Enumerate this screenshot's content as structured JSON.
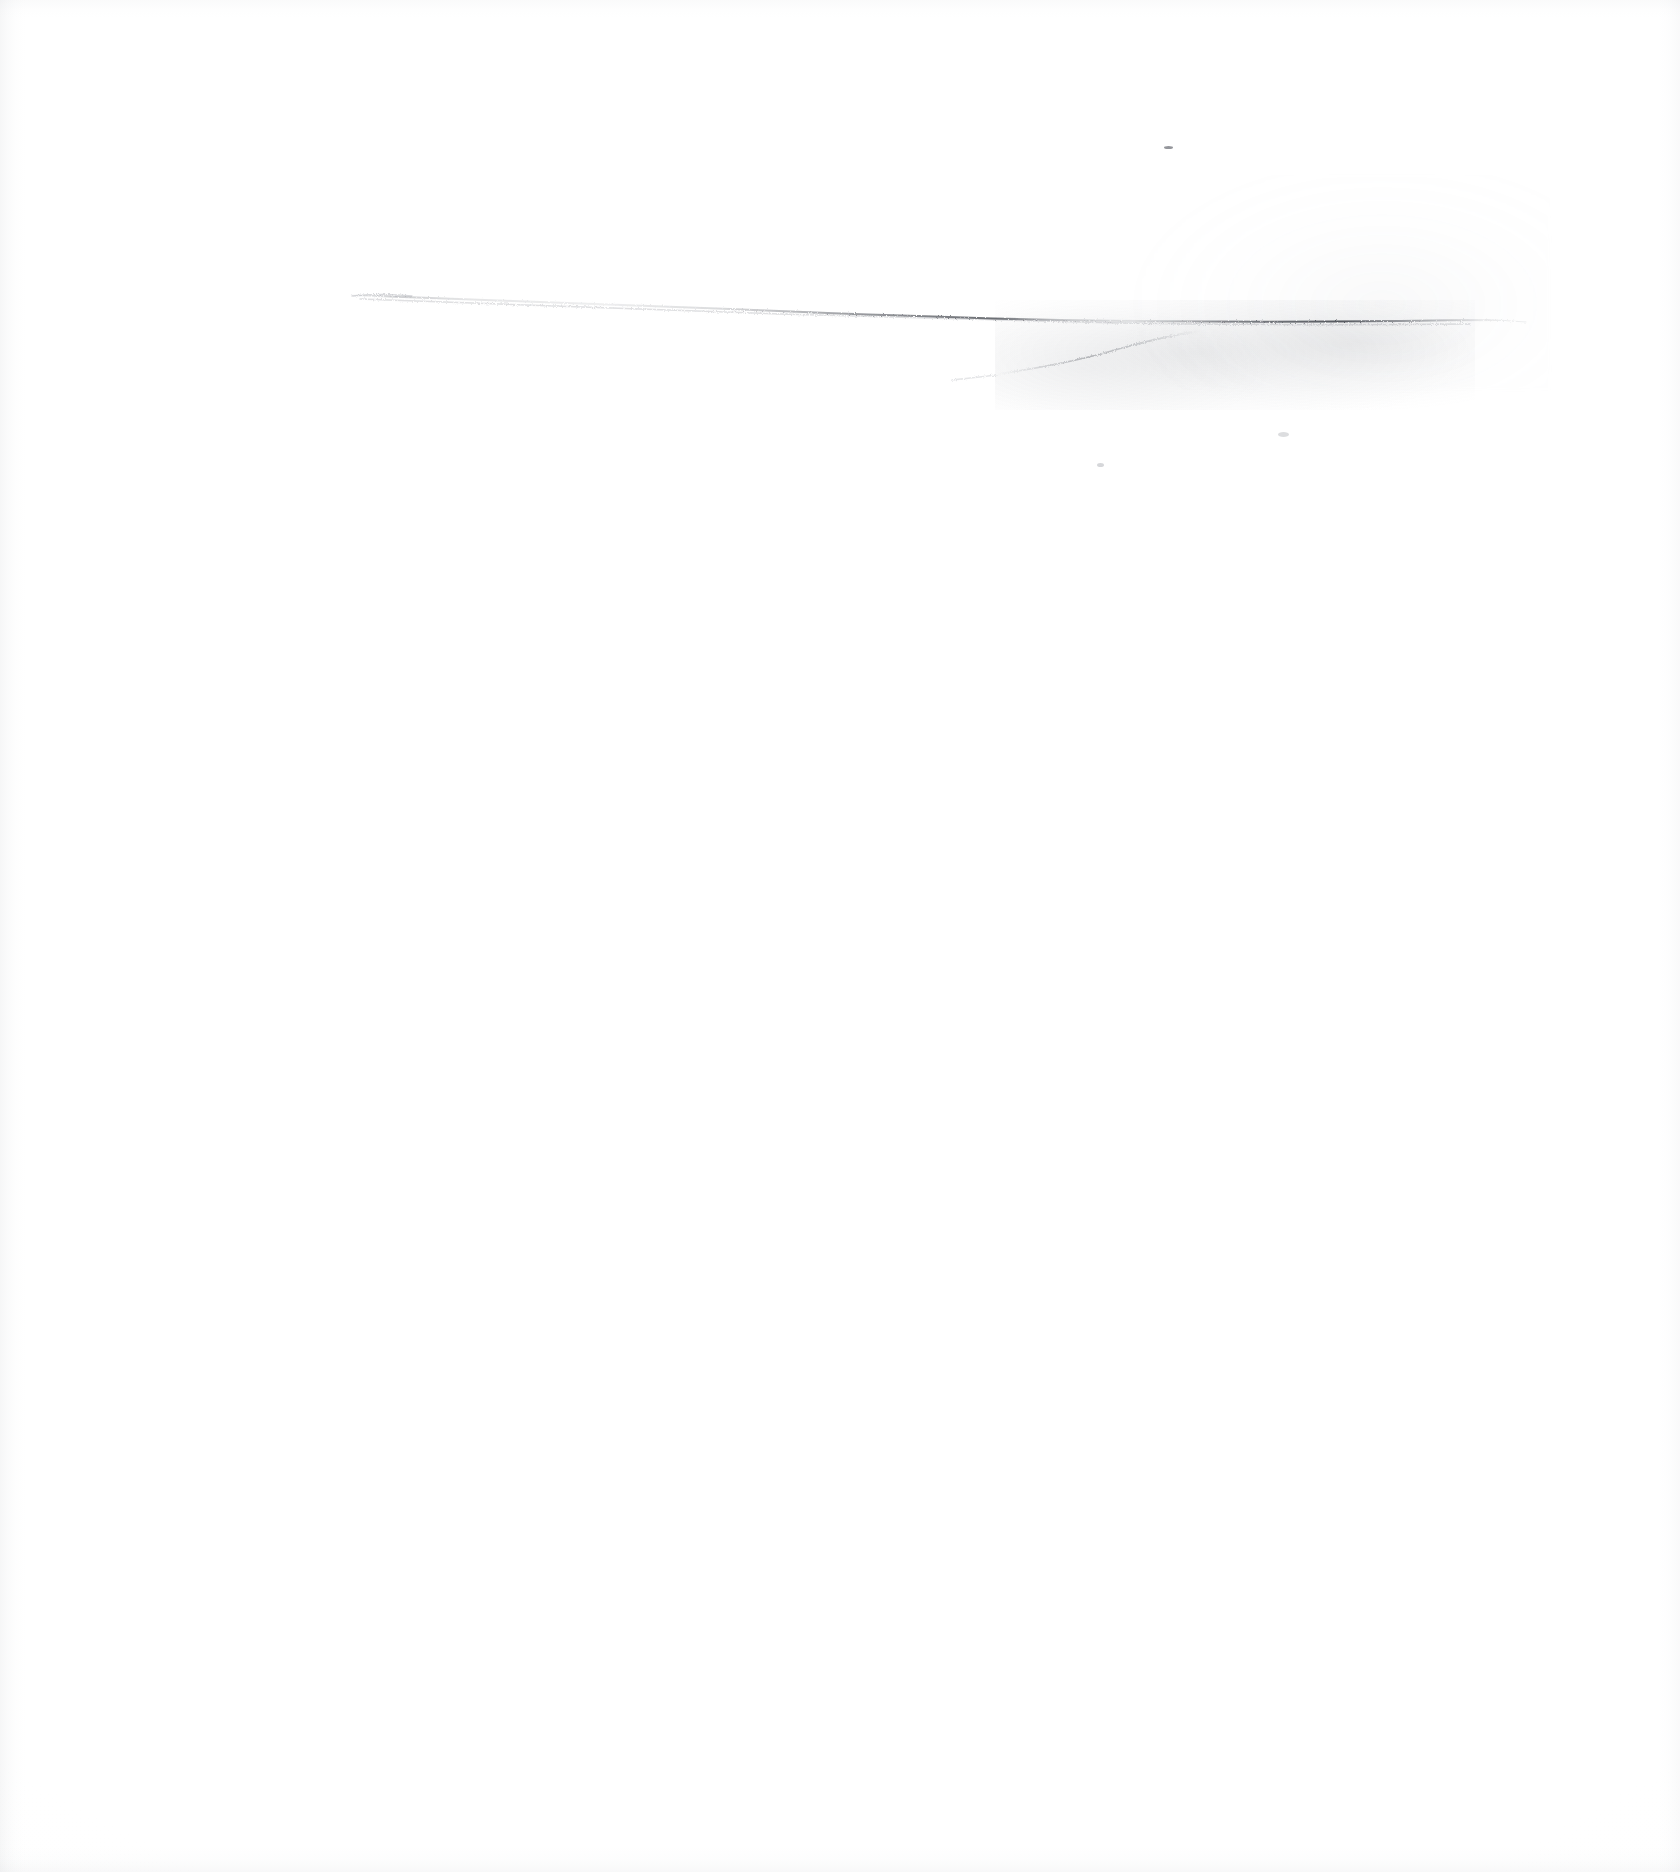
{
  "document": {
    "kind": "scanned-paper-sheet",
    "title": "Blank scanned page with faint graphite marking",
    "width": 1680,
    "height": 1872,
    "background_color": "#ffffff",
    "paper_tone": "#fefefe",
    "visible_text": "",
    "has_text": false
  },
  "marks": {
    "label": "faint pencil graphite marking",
    "description": "A single long, very light near-horizontal graphite stroke across the upper third of the sheet, darkening toward the right, where it merges into a diffuse smudged cloud of graphite.",
    "ink_color": "#5a5e66",
    "items": [
      {
        "name": "horizon-stroke",
        "type": "stroke",
        "x_start": 350,
        "y_start": 294,
        "x_end": 1500,
        "y_end": 322,
        "opacity": 0.55,
        "note": "gently descending then flattening; darkest between x=820 and x=1460"
      },
      {
        "name": "lower-branch-stroke",
        "type": "stroke",
        "x_start": 1000,
        "y_start": 372,
        "x_end": 1200,
        "y_end": 332,
        "opacity": 0.3,
        "note": "short ascending wisp rising to meet the main stroke"
      },
      {
        "name": "graphite-smudge-cloud",
        "type": "smudge",
        "x": 995,
        "y": 300,
        "width": 480,
        "height": 110,
        "opacity": 0.12
      },
      {
        "name": "upper-right-haze",
        "type": "smudge",
        "x": 1130,
        "y": 175,
        "width": 420,
        "height": 215,
        "opacity": 0.05
      },
      {
        "name": "isolated-speck-upper",
        "type": "speck",
        "x": 1164,
        "y": 146
      },
      {
        "name": "isolated-speck-lower-left",
        "type": "speck",
        "x": 1097,
        "y": 463
      },
      {
        "name": "isolated-speck-lower-right",
        "type": "speck",
        "x": 1278,
        "y": 432
      }
    ]
  },
  "scan_edges": {
    "left": "faint grey vertical band",
    "right": "faint grey vertical band",
    "top": "faint grey horizontal band",
    "bottom": "faint grey horizontal band"
  }
}
